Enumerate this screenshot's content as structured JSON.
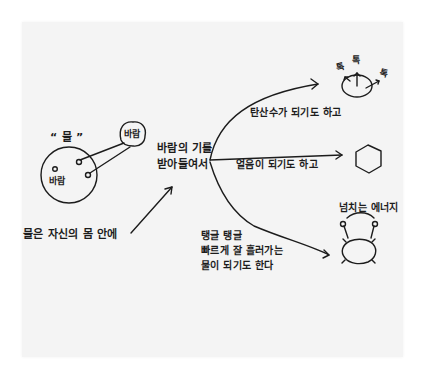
{
  "diagram": {
    "title_quote": "“ 물 ”",
    "water_label": "바람",
    "water_circle_label": "바람",
    "wind_bubble_label": "바람",
    "wind_prefix_label": "바람",
    "source_text": "물은 자신의 몸 안에",
    "center_text": {
      "line1": "바람의 기를",
      "line2": "받아들여서"
    },
    "branches": [
      {
        "label": "탄산수가 되기도 하고",
        "result_icon": "bubbling-circle-icon"
      },
      {
        "label": "얼음이 되기도 하고",
        "result_icon": "hexagon-ice-icon"
      },
      {
        "label_lines": [
          "탱글 탱글",
          "빠르게 잘 흘러가는",
          "물이 되기도 한다"
        ],
        "result_icon": "energetic-water-icon"
      }
    ],
    "bubble_sounds": [
      "톡",
      "톡",
      "톡"
    ],
    "energy_label": "넘치는 에너지",
    "colors": {
      "ink": "#1c1c1c",
      "paper": "#f4f4f4",
      "background": "#ffffff"
    }
  }
}
